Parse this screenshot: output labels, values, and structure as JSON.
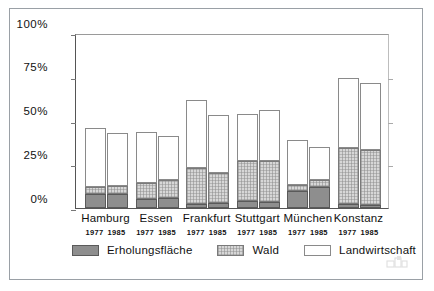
{
  "chart_data": {
    "type": "bar",
    "subtype": "stacked-bar",
    "title": "",
    "xlabel": "",
    "ylabel": "",
    "ylim": [
      0,
      100
    ],
    "yticks": [
      0,
      25,
      50,
      75,
      100
    ],
    "ytick_labels": [
      "0%",
      "25%",
      "50%",
      "75%",
      "100%"
    ],
    "grid": false,
    "legend_position": "bottom",
    "categories": [
      "Hamburg 1977",
      "Hamburg 1985",
      "Essen 1977",
      "Essen 1985",
      "Frankfurt 1977",
      "Frankfurt 1985",
      "Stuttgart 1977",
      "Stuttgart 1985",
      "München 1977",
      "München 1985",
      "Konstanz 1977",
      "Konstanz 1985"
    ],
    "groups": [
      {
        "city": "Hamburg",
        "years": [
          "1977",
          "1985"
        ]
      },
      {
        "city": "Essen",
        "years": [
          "1977",
          "1985"
        ]
      },
      {
        "city": "Frankfurt",
        "years": [
          "1977",
          "1985"
        ]
      },
      {
        "city": "Stuttgart",
        "years": [
          "1977",
          "1985"
        ]
      },
      {
        "city": "München",
        "years": [
          "1977",
          "1985"
        ]
      },
      {
        "city": "Konstanz",
        "years": [
          "1977",
          "1985"
        ]
      }
    ],
    "series": [
      {
        "name": "Erholungsfläche",
        "color": "#8e8e8e",
        "values": [
          8,
          8,
          5,
          5.5,
          2.5,
          3,
          4,
          3.5,
          10,
          12,
          2.5,
          2
        ]
      },
      {
        "name": "Wald",
        "color": "#d7d7d7",
        "values": [
          4,
          4.5,
          9.5,
          10.5,
          20.5,
          17,
          23,
          23.5,
          3,
          4,
          32,
          31
        ]
      },
      {
        "name": "Landwirtschaft",
        "color": "#ffffff",
        "values": [
          34,
          30.5,
          29,
          25,
          39,
          33,
          27,
          29,
          26,
          19,
          40,
          38.5
        ]
      }
    ],
    "cumulative_tops": {
      "erholungsflaeche": [
        8,
        8,
        5,
        5.5,
        2.5,
        3,
        4,
        3.5,
        10,
        12,
        2.5,
        2
      ],
      "wald": [
        12,
        12.5,
        14.5,
        16,
        23,
        20,
        27,
        27,
        13,
        16,
        34.5,
        33
      ],
      "landwirtschaft": [
        46,
        43,
        43.5,
        41,
        62,
        53,
        54,
        56,
        39,
        35,
        74.5,
        71.5
      ]
    }
  },
  "legend": {
    "items": [
      {
        "label": "Erholungsfläche",
        "swatch": "dark-gray-swatch"
      },
      {
        "label": "Wald",
        "swatch": "light-gray-hatched-swatch"
      },
      {
        "label": "Landwirtschaft",
        "swatch": "white-swatch"
      }
    ]
  },
  "watermark": {
    "name": "publisher-logo"
  }
}
